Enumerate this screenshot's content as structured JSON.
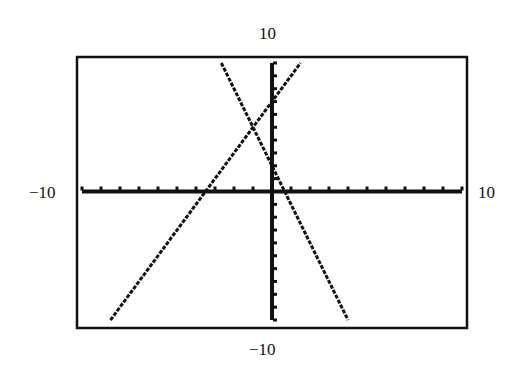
{
  "window": {
    "xmin_label": "−10",
    "xmax_label": "10",
    "ymin_label": "−10",
    "ymax_label": "10"
  },
  "chart_data": {
    "type": "line",
    "title": "",
    "xlabel": "",
    "ylabel": "",
    "xlim": [
      -10,
      10
    ],
    "ylim": [
      -10,
      10
    ],
    "xscale_tick": 1,
    "yscale_tick": 1,
    "grid": false,
    "series": [
      {
        "name": "y = -3x + 2",
        "slope": -3,
        "intercept": 2,
        "x": [
          -2.8,
          4.0
        ],
        "y": [
          10.4,
          -10.0
        ]
      },
      {
        "name": "y = 2x + 7",
        "slope": 2,
        "intercept": 7,
        "x": [
          -8.5,
          1.5
        ],
        "y": [
          -10.0,
          10.0
        ]
      }
    ],
    "annotations": [
      {
        "type": "intersection",
        "x": -1,
        "y": 5
      }
    ]
  },
  "colors": {
    "ink": "#111111",
    "background": "#ffffff"
  }
}
